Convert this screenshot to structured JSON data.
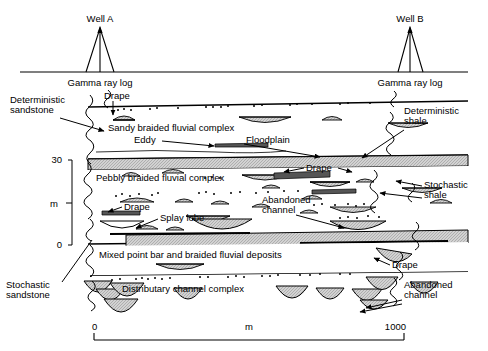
{
  "figure": {
    "type": "geological-cross-section",
    "title_present": false,
    "wells": [
      {
        "id": "well-a",
        "label": "Well A",
        "log_label": "Gamma ray log",
        "x_px": 100
      },
      {
        "id": "well-b",
        "label": "Well B",
        "log_label": "Gamma ray log",
        "x_px": 410
      }
    ],
    "vertical_axis": {
      "unit_label": "m",
      "ticks": [
        "30",
        "0"
      ],
      "top_value": "30",
      "bottom_value": "0"
    },
    "horizontal_scale": {
      "unit_label": "m",
      "left_value": "0",
      "right_value": "1000"
    },
    "unit_labels": [
      {
        "id": "sandy-braided",
        "text": "Sandy braided fluvial complex"
      },
      {
        "id": "pebbly-braided",
        "text": "Pebbly braided fluvial complex"
      },
      {
        "id": "mixed-point-bar",
        "text": "Mixed point bar and braided fluvial deposits"
      },
      {
        "id": "distributary-channel",
        "text": "Distributary channel complex"
      }
    ],
    "annotations": [
      {
        "id": "deterministic-sandstone",
        "text": "Deterministic\nsandstone",
        "line1": "Deterministic",
        "line2": "sandstone"
      },
      {
        "id": "stochastic-sandstone",
        "text": "Stochastic\nsandstone",
        "line1": "Stochastic",
        "line2": "sandstone"
      },
      {
        "id": "deterministic-shale",
        "text": "Deterministic\nshale",
        "line1": "Deterministic",
        "line2": "shale"
      },
      {
        "id": "stochastic-shale",
        "text": "Stochastic\nshale",
        "line1": "Stochastic",
        "line2": "shale"
      },
      {
        "id": "drape-top",
        "text": "Drape"
      },
      {
        "id": "drape-mid-right",
        "text": "Drape"
      },
      {
        "id": "drape-left",
        "text": "Drape"
      },
      {
        "id": "drape-bottom-right",
        "text": "Drape"
      },
      {
        "id": "eddy",
        "text": "Eddy"
      },
      {
        "id": "floodplain",
        "text": "Floodplain"
      },
      {
        "id": "splay-lobe",
        "text": "Splay lobe"
      },
      {
        "id": "abandoned-channel-mid",
        "line1": "Abandoned",
        "line2": "channel"
      },
      {
        "id": "abandoned-channel-bottom",
        "line1": "Abandoned",
        "line2": "channel"
      }
    ],
    "colors": {
      "ink": "#000000",
      "shale_fill": "#d6d6d6",
      "sand_fill": "#e8e8e8",
      "channel_fill": "#dcdcdc",
      "background": "#ffffff"
    }
  }
}
